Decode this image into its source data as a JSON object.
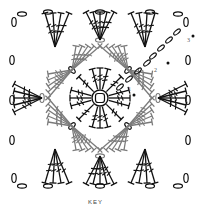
{
  "diagram": {
    "type": "crochet-chart",
    "center": [
      100,
      98
    ],
    "colors": {
      "round1": "#111111",
      "round2": "#7a7a7a",
      "round3": "#111111",
      "background": "#ffffff"
    },
    "rounds": [
      {
        "label": "1",
        "label_pos": [
          130,
          92
        ],
        "dot_pos": [
          134,
          95
        ]
      },
      {
        "label": "2",
        "label_pos": [
          155,
          73
        ],
        "dot_pos": [
          168,
          63
        ]
      },
      {
        "label": "3",
        "label_pos": [
          188,
          42
        ],
        "dot_pos": [
          193,
          36
        ]
      }
    ]
  },
  "key": {
    "label": "KEY"
  }
}
